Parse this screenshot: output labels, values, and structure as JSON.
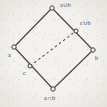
{
  "figure": {
    "kind": "hasse-diagram",
    "caption": "",
    "background_color": "#f4f2ee",
    "ink_color": "#433f3b"
  },
  "nodes": [
    {
      "id": "top",
      "label": "a∪b",
      "x": 52,
      "y": 8,
      "label_x": 60,
      "label_y": 2,
      "name": "node-a-union-b"
    },
    {
      "id": "cub",
      "label": "c∪b",
      "x": 76,
      "y": 31,
      "label_x": 80,
      "label_y": 20,
      "name": "node-c-union-b"
    },
    {
      "id": "left",
      "label": "a",
      "x": 14,
      "y": 47,
      "label_x": 8,
      "label_y": 52,
      "name": "node-a"
    },
    {
      "id": "right",
      "label": "b",
      "x": 93,
      "y": 50,
      "label_x": 95,
      "label_y": 55,
      "name": "node-b"
    },
    {
      "id": "c",
      "label": "c",
      "x": 30,
      "y": 66,
      "label_x": 23,
      "label_y": 70,
      "name": "node-c"
    },
    {
      "id": "bottom",
      "label": "a∩b",
      "x": 53,
      "y": 89,
      "label_x": 44,
      "label_y": 95,
      "name": "node-a-intersect-b"
    }
  ],
  "edges": [
    {
      "from": "left",
      "to": "top",
      "style": "solid",
      "name": "edge-a-to-a-union-b"
    },
    {
      "from": "top",
      "to": "right",
      "style": "solid",
      "name": "edge-a-union-b-to-b"
    },
    {
      "from": "left",
      "to": "bottom",
      "style": "solid",
      "name": "edge-a-to-a-intersect-b"
    },
    {
      "from": "bottom",
      "to": "right",
      "style": "solid",
      "name": "edge-a-intersect-b-to-b"
    },
    {
      "from": "c",
      "to": "cub",
      "style": "dashed",
      "name": "edge-c-to-c-union-b"
    }
  ],
  "node_style": {
    "radius": "2.2",
    "fill": "#f4f2ee",
    "stroke": "#433f3b"
  }
}
